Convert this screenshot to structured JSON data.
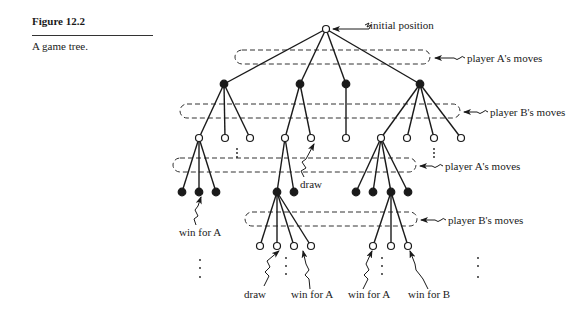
{
  "figure": {
    "label": "Figure 12.2",
    "caption": "A game tree."
  },
  "annotations": {
    "initial_position": "initial position",
    "player_a_moves_1": "player A's moves",
    "player_b_moves_1": "player B's moves",
    "player_a_moves_2": "player A's moves",
    "player_b_moves_2": "player B's moves",
    "draw_1": "draw",
    "win_for_a_1": "win for A",
    "draw_2": "draw",
    "win_for_a_2": "win for A",
    "win_for_a_3": "win for A",
    "win_for_b": "win for B"
  },
  "tree": {
    "root": {
      "x": 326,
      "y": 29,
      "type": "open"
    },
    "levels": [
      {
        "y": 84,
        "type": "filled",
        "player": "A"
      },
      {
        "y": 138,
        "type": "open",
        "player": "B"
      },
      {
        "y": 192,
        "type": "filled",
        "player": "A"
      },
      {
        "y": 246,
        "type": "open",
        "player": "B"
      }
    ]
  }
}
